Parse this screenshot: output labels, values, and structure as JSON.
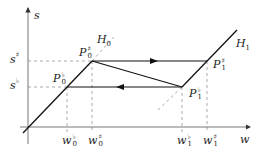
{
  "diagram": {
    "axes": {
      "x_label": "w",
      "y_label": "s"
    },
    "lines": [
      {
        "name": "H0",
        "label_base": "H",
        "label_sub": "0"
      },
      {
        "name": "H1",
        "label_base": "H",
        "label_sub": "1"
      }
    ],
    "points": {
      "P0_sharp": {
        "base": "P",
        "sup": "♯",
        "sub": "0"
      },
      "P0_flat": {
        "base": "P",
        "sup": "♭",
        "sub": "0"
      },
      "P1_sharp": {
        "base": "P",
        "sup": "♯",
        "sub": "1"
      },
      "P1_flat": {
        "base": "P",
        "sup": "♭",
        "sub": "1"
      }
    },
    "y_ticks": {
      "s_sharp": {
        "base": "s",
        "sup": "♯"
      },
      "s_flat": {
        "base": "s",
        "sup": "♭"
      }
    },
    "x_ticks": {
      "w0_flat": {
        "base": "w",
        "sup": "♭",
        "sub": "0"
      },
      "w0_sharp": {
        "base": "w",
        "sup": "♯",
        "sub": "0"
      },
      "w1_flat": {
        "base": "w",
        "sup": "♭",
        "sub": "1"
      },
      "w1_sharp": {
        "base": "w",
        "sup": "♯",
        "sub": "1"
      }
    },
    "colors": {
      "line": "#1a1a1a",
      "axis": "#555555",
      "dashed": "#777777"
    }
  }
}
